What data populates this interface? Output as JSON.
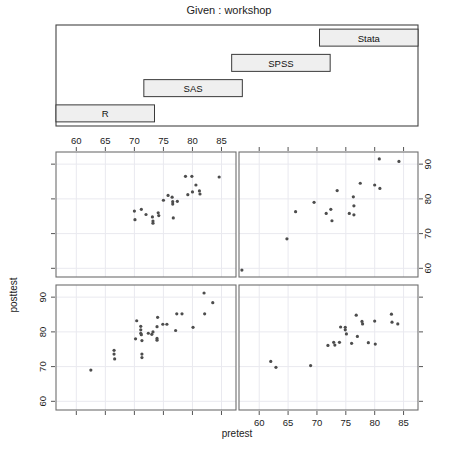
{
  "title": "Given : workshop",
  "strip": {
    "name": "given-workshop-strip",
    "levels": [
      "R",
      "SAS",
      "SPSS",
      "Stata"
    ]
  },
  "axes": {
    "xlabel": "pretest",
    "ylabel": "posttest",
    "x_ticks": [
      60,
      65,
      70,
      75,
      80,
      85
    ],
    "y_ticks": [
      60,
      70,
      80,
      90
    ],
    "xlim": [
      56.5,
      87.5
    ],
    "ylim": [
      57.5,
      93.5
    ],
    "top_axis_ticks": [
      60,
      65,
      70,
      75,
      80,
      85
    ],
    "bottom_axis_ticks": [
      60,
      65,
      70,
      75,
      80,
      85
    ],
    "left_axis_ticks": [
      60,
      70,
      80,
      90
    ],
    "right_axis_ticks": [
      60,
      70,
      80,
      90
    ]
  },
  "chart_data": {
    "type": "scatter",
    "title": "Given : workshop",
    "xlabel": "pretest",
    "ylabel": "posttest",
    "xlim": [
      56.5,
      87.5
    ],
    "ylim": [
      57.5,
      93.5
    ],
    "grid": true,
    "legend": "none",
    "conditioning_variable": "workshop",
    "layout": "2x2 trellis, strip bars ordered R, SAS, SPSS, Stata",
    "panels": [
      {
        "name": "panel-top-left",
        "row": 1,
        "col": 1,
        "level": "SPSS",
        "x_axis_position": "top",
        "y_axis_position": "left",
        "points": [
          {
            "x": 70.0,
            "y": 76.5
          },
          {
            "x": 70.1,
            "y": 74.0
          },
          {
            "x": 71.2,
            "y": 77.0
          },
          {
            "x": 72.0,
            "y": 75.5
          },
          {
            "x": 73.1,
            "y": 74.8
          },
          {
            "x": 73.2,
            "y": 73.6
          },
          {
            "x": 73.2,
            "y": 73.0
          },
          {
            "x": 74.1,
            "y": 76.0
          },
          {
            "x": 74.2,
            "y": 75.2
          },
          {
            "x": 75.0,
            "y": 79.6
          },
          {
            "x": 75.8,
            "y": 81.0
          },
          {
            "x": 76.5,
            "y": 80.5
          },
          {
            "x": 76.6,
            "y": 79.2
          },
          {
            "x": 76.6,
            "y": 78.5
          },
          {
            "x": 76.7,
            "y": 74.5
          },
          {
            "x": 77.4,
            "y": 79.3
          },
          {
            "x": 78.8,
            "y": 86.5
          },
          {
            "x": 79.2,
            "y": 81.2
          },
          {
            "x": 79.9,
            "y": 86.5
          },
          {
            "x": 80.0,
            "y": 82.0
          },
          {
            "x": 80.6,
            "y": 84.0
          },
          {
            "x": 81.2,
            "y": 82.3
          },
          {
            "x": 81.3,
            "y": 81.4
          },
          {
            "x": 84.6,
            "y": 86.3
          }
        ]
      },
      {
        "name": "panel-top-right",
        "row": 1,
        "col": 2,
        "level": "Stata",
        "x_axis_position": "top",
        "y_axis_position": "right",
        "points": [
          {
            "x": 57.0,
            "y": 59.5
          },
          {
            "x": 64.8,
            "y": 68.5
          },
          {
            "x": 66.3,
            "y": 76.3
          },
          {
            "x": 69.5,
            "y": 79.0
          },
          {
            "x": 71.6,
            "y": 75.8
          },
          {
            "x": 72.4,
            "y": 77.0
          },
          {
            "x": 72.6,
            "y": 73.7
          },
          {
            "x": 73.5,
            "y": 82.4
          },
          {
            "x": 75.6,
            "y": 75.8
          },
          {
            "x": 76.3,
            "y": 80.6
          },
          {
            "x": 76.4,
            "y": 78.0
          },
          {
            "x": 76.4,
            "y": 75.4
          },
          {
            "x": 77.5,
            "y": 84.5
          },
          {
            "x": 80.0,
            "y": 84.0
          },
          {
            "x": 80.9,
            "y": 83.0
          },
          {
            "x": 80.8,
            "y": 91.5
          },
          {
            "x": 84.2,
            "y": 90.8
          }
        ]
      },
      {
        "name": "panel-bottom-left",
        "row": 2,
        "col": 1,
        "level": "R",
        "x_axis_position": "bottom",
        "y_axis_position": "left",
        "points": [
          {
            "x": 62.5,
            "y": 69.0
          },
          {
            "x": 66.5,
            "y": 74.7
          },
          {
            "x": 66.5,
            "y": 73.6
          },
          {
            "x": 66.6,
            "y": 72.2
          },
          {
            "x": 70.4,
            "y": 83.2
          },
          {
            "x": 70.2,
            "y": 78.0
          },
          {
            "x": 71.1,
            "y": 81.6
          },
          {
            "x": 71.1,
            "y": 80.6
          },
          {
            "x": 71.1,
            "y": 79.6
          },
          {
            "x": 71.2,
            "y": 79.2
          },
          {
            "x": 71.3,
            "y": 77.5
          },
          {
            "x": 71.3,
            "y": 73.6
          },
          {
            "x": 71.3,
            "y": 72.6
          },
          {
            "x": 72.4,
            "y": 79.6
          },
          {
            "x": 73.0,
            "y": 79.3
          },
          {
            "x": 73.2,
            "y": 80.0
          },
          {
            "x": 74.0,
            "y": 84.2
          },
          {
            "x": 73.9,
            "y": 81.5
          },
          {
            "x": 73.9,
            "y": 78.1
          },
          {
            "x": 73.9,
            "y": 77.6
          },
          {
            "x": 74.9,
            "y": 82.2
          },
          {
            "x": 75.6,
            "y": 82.2
          },
          {
            "x": 77.3,
            "y": 85.2
          },
          {
            "x": 78.2,
            "y": 85.2
          },
          {
            "x": 77.1,
            "y": 80.4
          },
          {
            "x": 80.1,
            "y": 81.3
          },
          {
            "x": 82.0,
            "y": 91.2
          },
          {
            "x": 82.1,
            "y": 85.2
          },
          {
            "x": 83.5,
            "y": 88.4
          }
        ]
      },
      {
        "name": "panel-bottom-right",
        "row": 2,
        "col": 2,
        "level": "SAS",
        "x_axis_position": "bottom",
        "y_axis_position": "right",
        "points": [
          {
            "x": 62.0,
            "y": 71.5
          },
          {
            "x": 62.9,
            "y": 69.8
          },
          {
            "x": 68.9,
            "y": 70.3
          },
          {
            "x": 71.9,
            "y": 76.1
          },
          {
            "x": 72.9,
            "y": 77.0
          },
          {
            "x": 73.1,
            "y": 76.2
          },
          {
            "x": 73.9,
            "y": 77.0
          },
          {
            "x": 74.1,
            "y": 81.4
          },
          {
            "x": 74.9,
            "y": 81.3
          },
          {
            "x": 74.9,
            "y": 80.6
          },
          {
            "x": 75.1,
            "y": 79.4
          },
          {
            "x": 76.0,
            "y": 76.7
          },
          {
            "x": 76.8,
            "y": 84.8
          },
          {
            "x": 77.0,
            "y": 78.7
          },
          {
            "x": 77.8,
            "y": 83.0
          },
          {
            "x": 77.9,
            "y": 82.3
          },
          {
            "x": 78.9,
            "y": 76.9
          },
          {
            "x": 80.0,
            "y": 83.1
          },
          {
            "x": 80.1,
            "y": 76.5
          },
          {
            "x": 82.9,
            "y": 85.1
          },
          {
            "x": 83.0,
            "y": 82.8
          },
          {
            "x": 84.0,
            "y": 82.3
          }
        ]
      }
    ]
  }
}
